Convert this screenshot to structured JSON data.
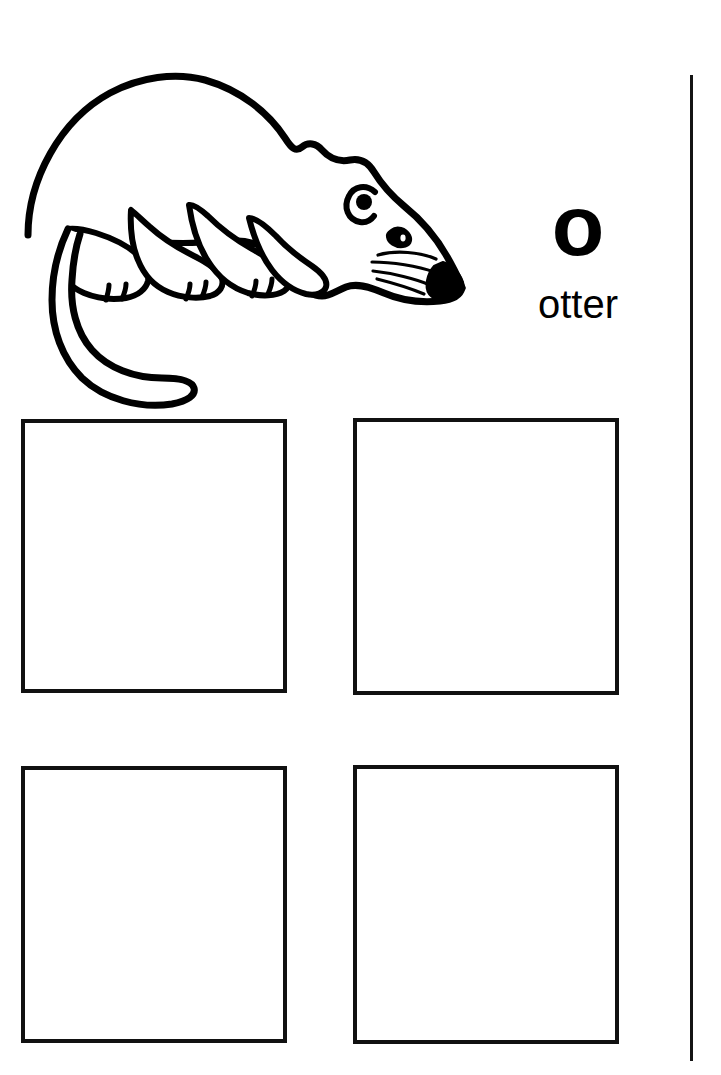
{
  "page": {
    "background_color": "#ffffff",
    "ink_color": "#000000",
    "width": 721,
    "height": 1075
  },
  "illustration": {
    "name": "otter-line-drawing",
    "subject": "otter",
    "style": "black outline coloring-page line art",
    "description": "Side view of an otter facing right, head lowered, with long curving tail sweeping down to the left, four legs with toes, visible ear, eye, whiskers and a solid black nose.",
    "fill": "#ffffff",
    "stroke": "#000000",
    "details": [
      "ear",
      "eye",
      "nose",
      "whiskers",
      "tail",
      "front-legs",
      "hind-legs",
      "toes"
    ]
  },
  "letter": {
    "glyph": "o",
    "case": "lowercase",
    "word": "otter",
    "glyph_color": "#000000",
    "word_color": "#000000"
  },
  "divider": {
    "orientation": "vertical",
    "color": "#141414"
  },
  "boxes": [
    {
      "id": "box-1",
      "label": "",
      "position": "top-left"
    },
    {
      "id": "box-2",
      "label": "",
      "position": "top-right"
    },
    {
      "id": "box-3",
      "label": "",
      "position": "bottom-left"
    },
    {
      "id": "box-4",
      "label": "",
      "position": "bottom-right"
    }
  ]
}
